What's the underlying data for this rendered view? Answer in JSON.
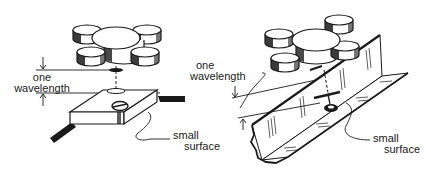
{
  "figure": {
    "left_panel": {
      "label_distance_line1": "one",
      "label_distance_line2": "wavelength",
      "label_surface_line1": "small",
      "label_surface_line2": "surface"
    },
    "right_panel": {
      "label_distance_line1": "one",
      "label_distance_line2": "wavelength",
      "label_surface_line1": "small",
      "label_surface_line2": "surface"
    }
  },
  "colors": {
    "ink": "#1a1a1a",
    "background": "#ffffff"
  }
}
